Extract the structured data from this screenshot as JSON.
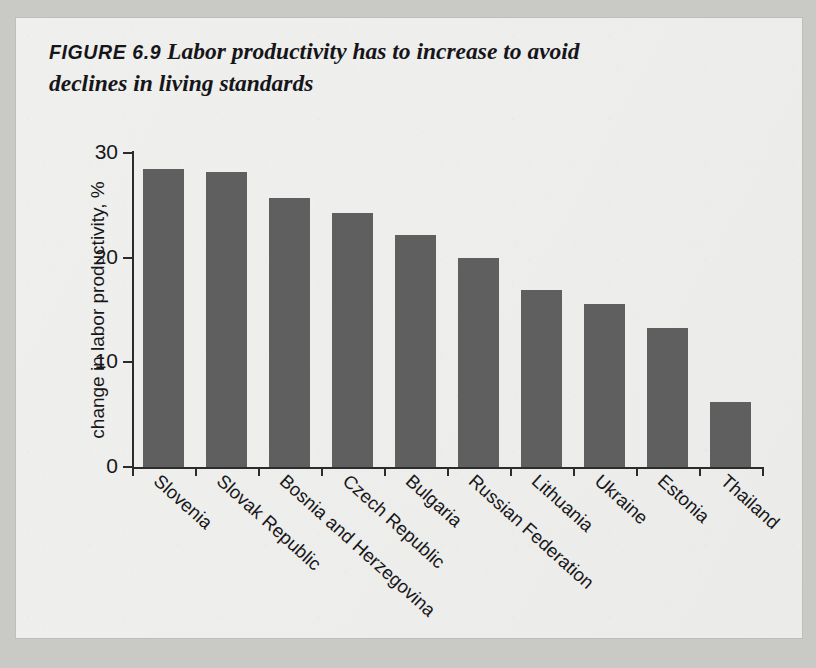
{
  "figure": {
    "label": "FIGURE 6.9",
    "title_line1": "Labor productivity has to increase to avoid",
    "title_line2": "declines in living standards",
    "title_full": "FIGURE 6.9 Labor productivity has to increase to avoid declines in living standards"
  },
  "colors": {
    "bar": "#5f5f5f",
    "axis": "#2c2c2c",
    "text": "#17171a",
    "paper": "#eeeeec",
    "page_edge": "#c9c9c5"
  },
  "chart_data": {
    "type": "bar",
    "title": "Labor productivity has to increase to avoid declines in living standards",
    "xlabel": "",
    "ylabel": "change in labor productivity, %",
    "categories": [
      "Slovenia",
      "Slovak Republic",
      "Bosnia and Herzegovina",
      "Czech Republic",
      "Bulgaria",
      "Russian Federation",
      "Lithuania",
      "Ukraine",
      "Estonia",
      "Thailand"
    ],
    "values": [
      28.5,
      28.2,
      25.7,
      24.3,
      22.2,
      20.0,
      16.9,
      15.6,
      13.3,
      6.2
    ],
    "ylim": [
      0,
      30
    ],
    "yticks": [
      0,
      10,
      20,
      30
    ],
    "ytick_labels": [
      "0",
      "10",
      "20",
      "30"
    ],
    "grid": false,
    "legend": false,
    "orientation": "vertical",
    "bar_color": "#5f5f5f"
  }
}
